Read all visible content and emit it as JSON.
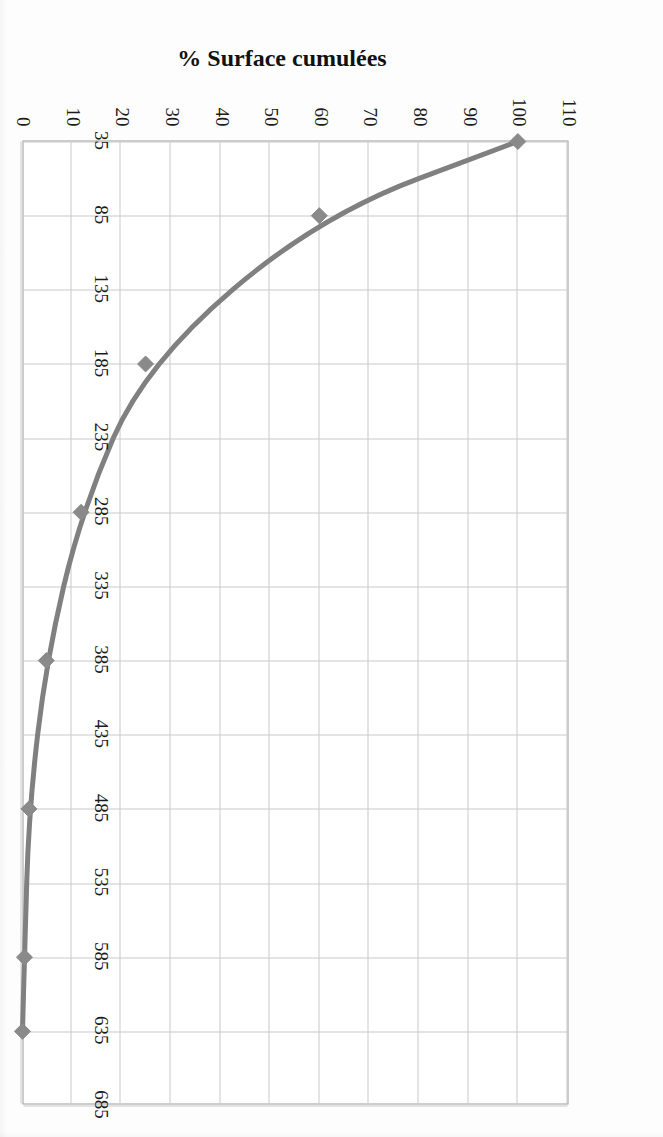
{
  "figure": {
    "orientation_degrees": 90,
    "background_color": "#ffffff",
    "plot_border_color": "#9a9a9a",
    "gridline_color": "#c9c9c9",
    "series_color": "#808080",
    "marker_color": "#8a8a8a"
  },
  "chart_data": {
    "type": "line",
    "title": "",
    "xlabel": "Altitude (m)",
    "ylabel": "% Surface cumulées",
    "xlim": [
      35,
      685
    ],
    "ylim": [
      0,
      110
    ],
    "grid": true,
    "legend": null,
    "x_ticks": [
      35,
      85,
      135,
      185,
      235,
      285,
      335,
      385,
      435,
      485,
      535,
      585,
      635,
      685
    ],
    "y_ticks": [
      0,
      10,
      20,
      30,
      40,
      50,
      60,
      70,
      80,
      90,
      100,
      110
    ],
    "series": [
      {
        "name": "% Surface cumulées",
        "marker": "diamond",
        "x": [
          35,
          85,
          185,
          285,
          385,
          485,
          585,
          635
        ],
        "values": [
          100,
          60,
          25,
          12,
          5,
          1.5,
          0.6,
          0.2
        ]
      }
    ]
  }
}
